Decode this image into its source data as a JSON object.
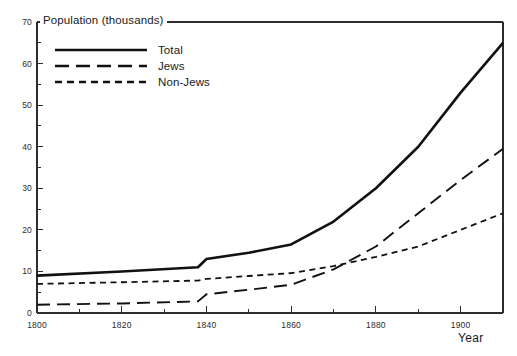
{
  "chart_data": {
    "type": "line",
    "title": "Population (thousands)",
    "xlabel": "Year",
    "ylabel": "Population (thousands)",
    "xlim": [
      1800,
      1910
    ],
    "ylim": [
      0,
      70
    ],
    "grid": false,
    "legend_position": "top-left",
    "y_ticks_major": [
      0,
      10,
      20,
      30,
      40,
      50,
      60,
      70
    ],
    "y_ticks_minor": [
      5,
      15,
      25,
      35,
      45,
      55,
      65
    ],
    "x_ticks_major": [
      1800,
      1820,
      1840,
      1860,
      1880,
      1900
    ],
    "x_ticks_minor": [
      1810,
      1830,
      1850,
      1870,
      1890,
      1910
    ],
    "x_tick_labels": [
      "1800",
      "1820",
      "1840",
      "1860",
      "1880",
      "1900"
    ],
    "y_tick_labels": [
      "0",
      "10",
      "20",
      "30",
      "40",
      "50",
      "60",
      "70"
    ],
    "series": [
      {
        "name": "Total",
        "style": "solid",
        "color": "#111111",
        "x": [
          1800,
          1820,
          1838,
          1840,
          1850,
          1860,
          1870,
          1880,
          1890,
          1900,
          1910
        ],
        "values": [
          9.0,
          10.0,
          11.0,
          13.0,
          14.5,
          16.5,
          22.0,
          30.0,
          40.0,
          53.0,
          65.0
        ]
      },
      {
        "name": "Jews",
        "style": "long-dash",
        "color": "#111111",
        "x": [
          1800,
          1820,
          1838,
          1840,
          1850,
          1860,
          1870,
          1880,
          1890,
          1900,
          1910
        ],
        "values": [
          2.0,
          2.3,
          2.8,
          4.5,
          5.6,
          6.8,
          10.5,
          16.0,
          24.0,
          32.0,
          39.5
        ]
      },
      {
        "name": "Non-Jews",
        "style": "short-dash",
        "color": "#111111",
        "x": [
          1800,
          1820,
          1838,
          1840,
          1850,
          1860,
          1870,
          1880,
          1890,
          1900,
          1910
        ],
        "values": [
          7.0,
          7.4,
          7.8,
          8.2,
          8.9,
          9.6,
          11.3,
          13.5,
          16.0,
          20.0,
          24.0
        ]
      }
    ]
  },
  "legend": {
    "items": [
      {
        "label": "Total",
        "style": "solid"
      },
      {
        "label": "Jews",
        "style": "long-dash"
      },
      {
        "label": "Non-Jews",
        "style": "short-dash"
      }
    ]
  },
  "axes": {
    "x_title": "Year"
  }
}
